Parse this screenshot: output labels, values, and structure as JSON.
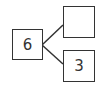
{
  "diagram": {
    "type": "number-bond",
    "whole": {
      "value": "6"
    },
    "parts": [
      {
        "value": ""
      },
      {
        "value": "3"
      }
    ],
    "colors": {
      "stroke": "#333333",
      "background": "#ffffff"
    }
  }
}
